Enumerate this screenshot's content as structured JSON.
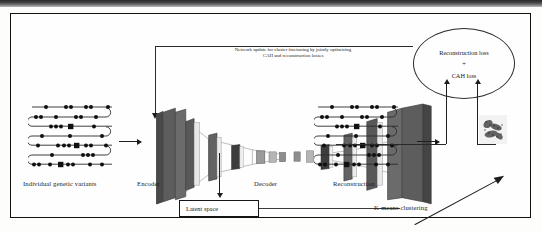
{
  "figure": {
    "type": "architecture-diagram",
    "border_color": "#111111",
    "background": "#fefefe"
  },
  "feedback": {
    "text_line1": "Network update for cluster finetuning by jointly optimizing",
    "text_line2": "CAH and reconstruction losses"
  },
  "loss_node": {
    "line1": "Reconstruction loss",
    "plus": "+",
    "line2": "CAH loss",
    "shape": "ellipse"
  },
  "labels": {
    "input": "Individual genetic variants",
    "encoder": "Encoder",
    "decoder": "Decoder",
    "reconstruction": "Reconstruction",
    "latent_space": "Latent space",
    "kmeans": "K-means clustering"
  },
  "blocks": {
    "encoder_layers": 6,
    "decoder_layers": 6,
    "bottleneck_label": "latent code",
    "layer_fill": "#6e6e6e",
    "layer_side": "#4a4a4a"
  },
  "genome": {
    "rows": 7,
    "description": "serpentine chromosome track with variant dots",
    "dot_color": "#111111",
    "track_color": "#333333"
  },
  "cluster_plot": {
    "description": "grayscale k-means cluster scatter thumbnail",
    "clusters": 3
  },
  "arrows": {
    "input_to_encoder": "right",
    "decoder_to_reconstruction": "right",
    "encoder_to_latent": "down",
    "reconstruction_to_loss": "up",
    "clustering_to_loss": "up",
    "loss_to_encoder": "left-then-down",
    "latent_to_clustering": "diagonal-up-right"
  }
}
